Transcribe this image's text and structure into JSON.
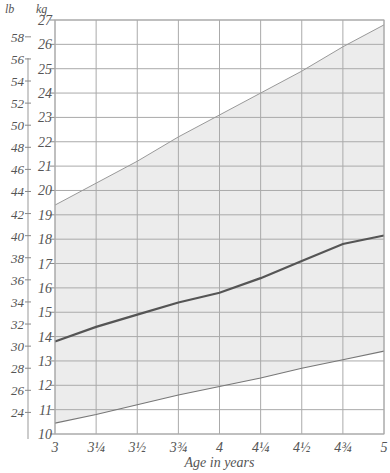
{
  "chart_data": {
    "type": "line",
    "title": "",
    "xlabel": "Age in years",
    "ylabel_left": "lb",
    "ylabel_right": "kg",
    "x": [
      3,
      3.25,
      3.5,
      3.75,
      4,
      4.25,
      4.5,
      4.75,
      5
    ],
    "x_tick_labels": [
      "3",
      "3¼",
      "3½",
      "3¾",
      "4",
      "4¼",
      "4½",
      "4¾",
      "5"
    ],
    "kg_ticks": [
      10,
      11,
      12,
      13,
      14,
      15,
      16,
      17,
      18,
      19,
      20,
      21,
      22,
      23,
      24,
      25,
      26,
      27
    ],
    "lb_ticks": [
      24,
      26,
      28,
      30,
      32,
      34,
      36,
      38,
      40,
      42,
      44,
      46,
      48,
      50,
      52,
      54,
      56,
      58
    ],
    "ylim_kg": [
      10,
      27
    ],
    "grid": true,
    "series": [
      {
        "name": "upper",
        "values": [
          19.4,
          20.3,
          21.2,
          22.2,
          23.1,
          24.0,
          24.9,
          25.9,
          26.8
        ]
      },
      {
        "name": "median",
        "values": [
          13.8,
          14.4,
          14.9,
          15.4,
          15.8,
          16.4,
          17.1,
          17.8,
          18.15
        ]
      },
      {
        "name": "lower",
        "values": [
          10.45,
          10.8,
          11.2,
          11.6,
          11.95,
          12.3,
          12.7,
          13.05,
          13.4
        ]
      }
    ]
  }
}
